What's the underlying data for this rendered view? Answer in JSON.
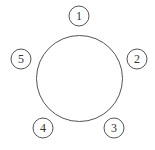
{
  "diagram": {
    "type": "round-table-seating",
    "table": {
      "cx": 79.5,
      "cy": 78.5,
      "r": 43,
      "stroke": "#555555"
    },
    "seat_radius": 10,
    "seat_stroke": "#555555",
    "seats": [
      {
        "label": "1",
        "cx": 79,
        "cy": 16
      },
      {
        "label": "2",
        "cx": 137,
        "cy": 59
      },
      {
        "label": "3",
        "cx": 114,
        "cy": 128
      },
      {
        "label": "4",
        "cx": 43,
        "cy": 128
      },
      {
        "label": "5",
        "cx": 21,
        "cy": 59
      }
    ]
  }
}
